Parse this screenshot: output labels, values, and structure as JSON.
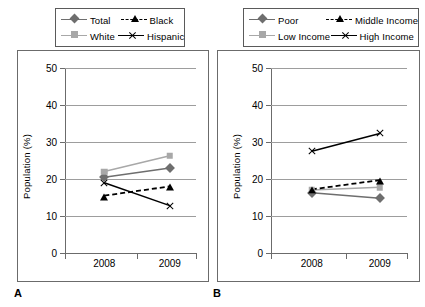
{
  "chart_data": [
    {
      "type": "line",
      "panel": "A",
      "title": "",
      "xlabel": "",
      "ylabel": "Population (%)",
      "categories": [
        "2008",
        "2009"
      ],
      "x": [
        "2008",
        "2009"
      ],
      "ylim": [
        0,
        50
      ],
      "yticks": [
        0,
        10,
        20,
        30,
        40,
        50
      ],
      "grid": true,
      "legend_position": "top",
      "series": [
        {
          "name": "Total",
          "values": [
            20.5,
            23.0
          ],
          "color": "#6e6e6e",
          "marker": "diamond",
          "line": "solid"
        },
        {
          "name": "White",
          "values": [
            22.0,
            26.3
          ],
          "color": "#a8a8a8",
          "marker": "square",
          "line": "solid"
        },
        {
          "name": "Black",
          "values": [
            15.5,
            18.0
          ],
          "color": "#000000",
          "marker": "triangle",
          "line": "dashed"
        },
        {
          "name": "Hispanic",
          "values": [
            19.0,
            12.8
          ],
          "color": "#000000",
          "marker": "cross",
          "line": "solid"
        }
      ]
    },
    {
      "type": "line",
      "panel": "B",
      "title": "",
      "xlabel": "",
      "ylabel": "Population (%)",
      "categories": [
        "2008",
        "2009"
      ],
      "x": [
        "2008",
        "2009"
      ],
      "ylim": [
        0,
        50
      ],
      "yticks": [
        0,
        10,
        20,
        30,
        40,
        50
      ],
      "grid": true,
      "legend_position": "top",
      "series": [
        {
          "name": "Poor",
          "values": [
            16.3,
            14.8
          ],
          "color": "#6e6e6e",
          "marker": "diamond",
          "line": "solid"
        },
        {
          "name": "Low Income",
          "values": [
            17.0,
            17.8
          ],
          "color": "#a8a8a8",
          "marker": "square",
          "line": "solid"
        },
        {
          "name": "Middle Income",
          "values": [
            17.2,
            19.7
          ],
          "color": "#000000",
          "marker": "triangle",
          "line": "dashed"
        },
        {
          "name": "High Income",
          "values": [
            27.5,
            32.3
          ],
          "color": "#000000",
          "marker": "cross",
          "line": "solid"
        }
      ]
    }
  ],
  "panels": [
    {
      "letter": "A",
      "ylabel": "Population (%)",
      "yticks": [
        "50",
        "40",
        "30",
        "20",
        "10",
        "0"
      ],
      "xticks": [
        "2008",
        "2009"
      ],
      "legend": [
        {
          "label": "Total",
          "marker": "diamond",
          "line": "solid",
          "color": "#6e6e6e"
        },
        {
          "label": "Black",
          "marker": "triangle",
          "line": "dashed",
          "color": "#000000"
        },
        {
          "label": "White",
          "marker": "square",
          "line": "solid",
          "color": "#a8a8a8"
        },
        {
          "label": "Hispanic",
          "marker": "cross",
          "line": "solid",
          "color": "#000000"
        }
      ]
    },
    {
      "letter": "B",
      "ylabel": "Population (%)",
      "yticks": [
        "50",
        "40",
        "30",
        "20",
        "10",
        "0"
      ],
      "xticks": [
        "2008",
        "2009"
      ],
      "legend": [
        {
          "label": "Poor",
          "marker": "diamond",
          "line": "solid",
          "color": "#6e6e6e"
        },
        {
          "label": "Middle Income",
          "marker": "triangle",
          "line": "dashed",
          "color": "#000000"
        },
        {
          "label": "Low Income",
          "marker": "square",
          "line": "solid",
          "color": "#a8a8a8"
        },
        {
          "label": "High Income",
          "marker": "cross",
          "line": "solid",
          "color": "#000000"
        }
      ]
    }
  ],
  "colors": {
    "series_dark_gray": "#6e6e6e",
    "series_light_gray": "#a8a8a8",
    "series_black": "#000000",
    "gridline": "#9d9d9d",
    "axis": "#6b6b6b",
    "frame": "#6b6b6b",
    "background": "#ffffff"
  }
}
